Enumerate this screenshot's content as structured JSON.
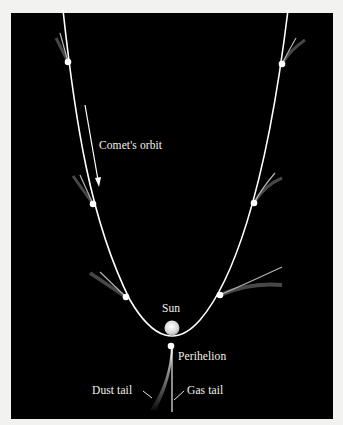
{
  "figure": {
    "background_color": "#000000",
    "page_color": "#f2f2f0",
    "line_color": "#ffffff",
    "labels": {
      "orbit": "Comet's orbit",
      "sun": "Sun",
      "perihelion": "Perihelion",
      "dust_tail": "Dust tail",
      "gas_tail": "Gas tail"
    },
    "comet_positions": [
      {
        "name": "top-left",
        "x": 68,
        "y": 62
      },
      {
        "name": "mid-left",
        "x": 93,
        "y": 204
      },
      {
        "name": "low-left",
        "x": 126,
        "y": 297
      },
      {
        "name": "perihelion",
        "x": 171,
        "y": 346
      },
      {
        "name": "low-right",
        "x": 220,
        "y": 295
      },
      {
        "name": "mid-right",
        "x": 254,
        "y": 203
      },
      {
        "name": "top-right",
        "x": 282,
        "y": 64
      }
    ]
  }
}
